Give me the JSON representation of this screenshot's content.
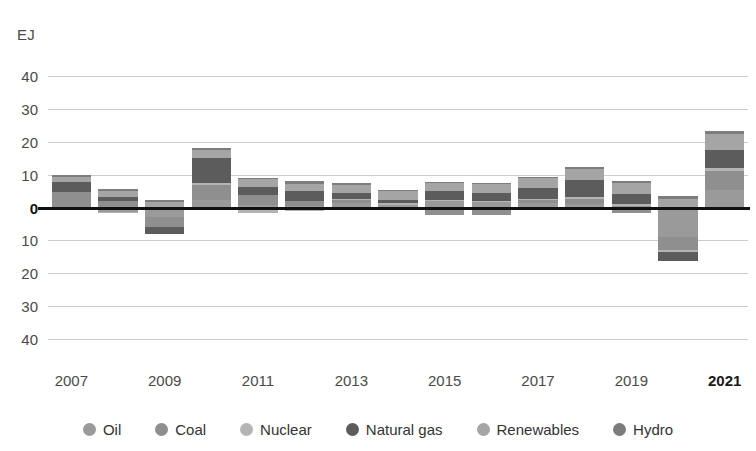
{
  "chart_data": {
    "type": "bar",
    "subtype": "stacked-diverging",
    "title": "",
    "subtitle": "",
    "xlabel": "",
    "ylabel": "EJ",
    "unit": "EJ",
    "grid": true,
    "legend_position": "bottom",
    "ylim": [
      -45,
      45
    ],
    "ytick_values": [
      40,
      30,
      20,
      10,
      0,
      -10,
      -20,
      -30,
      -40
    ],
    "ytick_labels": [
      "40",
      "30",
      "20",
      "10",
      "0",
      "10",
      "20",
      "30",
      "40"
    ],
    "categories": [
      2007,
      2008,
      2009,
      2010,
      2011,
      2012,
      2013,
      2014,
      2015,
      2016,
      2017,
      2018,
      2019,
      2020,
      2021
    ],
    "xtick_labels": [
      "2007",
      "2009",
      "2011",
      "2013",
      "2015",
      "2017",
      "2019",
      "2021"
    ],
    "xtick_years": [
      2007,
      2009,
      2011,
      2013,
      2015,
      2017,
      2019,
      2021
    ],
    "highlighted_xtick": "2021",
    "series": [
      {
        "name": "Oil",
        "color": "#9a9a9a",
        "values": [
          -0.3,
          -1.3,
          -2.8,
          2.2,
          0.7,
          0.6,
          1.3,
          0.9,
          2.0,
          1.6,
          1.3,
          1.2,
          0.6,
          -9.0,
          5.3
        ]
      },
      {
        "name": "Coal",
        "color": "#8f8f8f",
        "values": [
          4.6,
          2.0,
          -3.0,
          4.8,
          3.0,
          1.5,
          1.0,
          -0.4,
          -2.2,
          -2.4,
          0.9,
          1.4,
          -1.6,
          -4.0,
          5.8
        ]
      },
      {
        "name": "Nuclear",
        "color": "#b4b4b4",
        "values": [
          -0.6,
          -0.1,
          -0.3,
          0.5,
          -1.6,
          -1.2,
          0.2,
          0.5,
          0.4,
          0.3,
          0.3,
          0.6,
          0.6,
          -0.6,
          1.0
        ]
      },
      {
        "name": "Natural gas",
        "color": "#5c5c5c",
        "values": [
          3.3,
          1.2,
          -1.9,
          7.7,
          2.6,
          2.8,
          1.8,
          1.0,
          2.6,
          2.4,
          3.4,
          5.2,
          2.9,
          -2.6,
          5.3
        ]
      },
      {
        "name": "Renewables",
        "color": "#a5a5a5",
        "values": [
          1.4,
          1.8,
          1.8,
          2.2,
          2.4,
          2.2,
          2.6,
          2.6,
          2.5,
          2.8,
          3.2,
          3.3,
          3.4,
          2.6,
          5.1
        ]
      },
      {
        "name": "Hydro",
        "color": "#7d7d7d",
        "values": [
          0.7,
          0.7,
          0.6,
          0.9,
          0.3,
          1.1,
          0.7,
          0.4,
          0.2,
          0.5,
          0.3,
          0.6,
          0.5,
          0.9,
          0.8
        ]
      }
    ],
    "bar_totals_positive": [
      15.0,
      7.8,
      0.9,
      24.9,
      12.5,
      9.8,
      8.5,
      5.5,
      8.2,
      8.3,
      9.5,
      15.0,
      6.4,
      3.5,
      30.8
    ],
    "bar_totals_negative": [
      -0.9,
      -1.4,
      -8.0,
      0.0,
      -0.5,
      -1.2,
      0.0,
      -0.4,
      -3.1,
      -2.6,
      0.0,
      0.0,
      -1.6,
      -28.3,
      0.0
    ]
  },
  "legend": {
    "items": [
      {
        "label": "Oil",
        "swatch": "oil-swatch",
        "color": "#9a9a9a"
      },
      {
        "label": "Coal",
        "swatch": "coal-swatch",
        "color": "#8f8f8f"
      },
      {
        "label": "Nuclear",
        "swatch": "nuclear-swatch",
        "color": "#b4b4b4"
      },
      {
        "label": "Natural gas",
        "swatch": "natural-gas-swatch",
        "color": "#5c5c5c"
      },
      {
        "label": "Renewables",
        "swatch": "renewables-swatch",
        "color": "#a5a5a5"
      },
      {
        "label": "Hydro",
        "swatch": "hydro-swatch",
        "color": "#7d7d7d"
      }
    ]
  }
}
